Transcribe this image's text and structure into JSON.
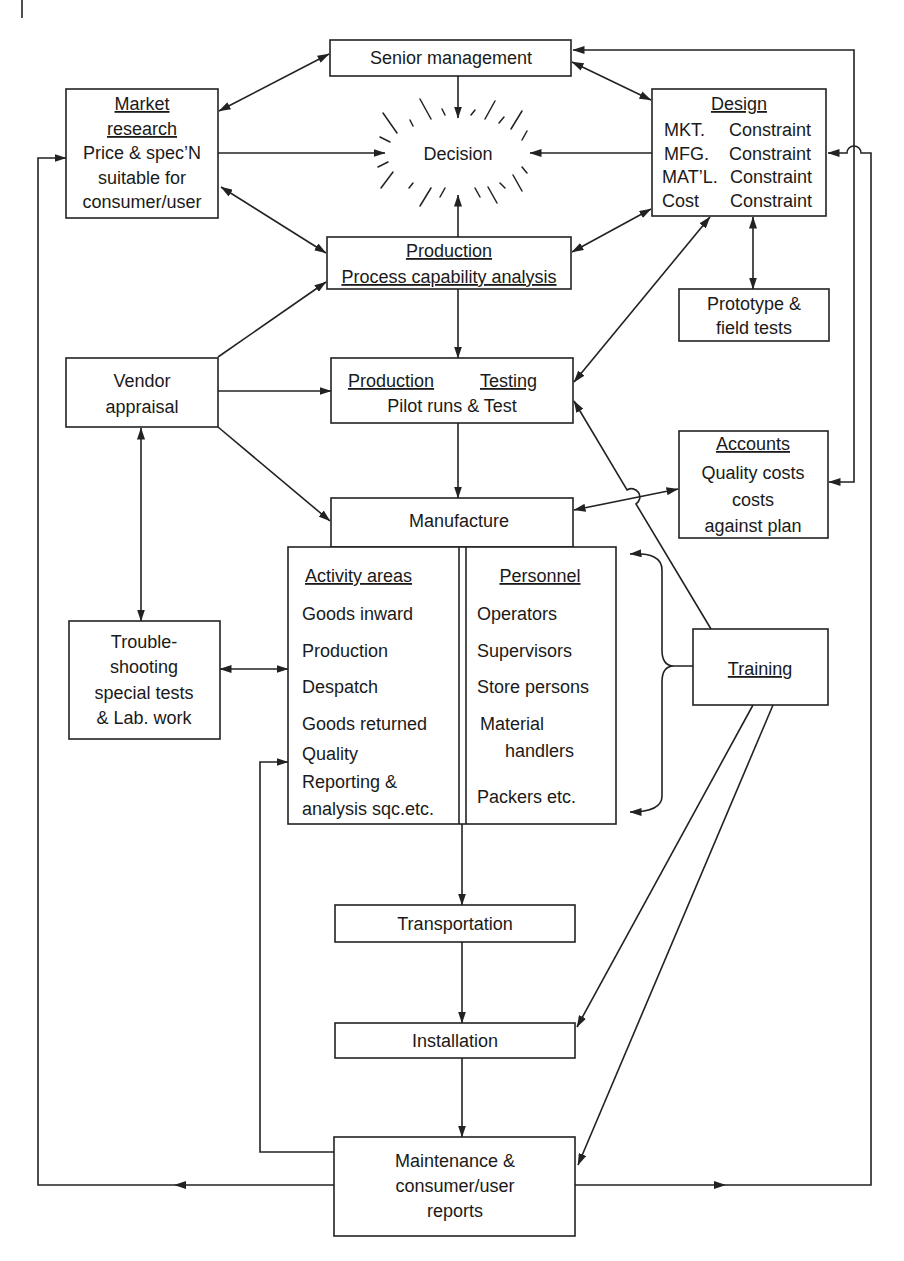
{
  "diagram": {
    "colors": {
      "stroke": "#222222",
      "text": "#1a1a1a",
      "background": "#ffffff"
    },
    "senior_management": {
      "label": "Senior management"
    },
    "decision": {
      "label": "Decision"
    },
    "market_research": {
      "title_line1": "Market",
      "title_line2": "research",
      "lines": [
        "Price & spec’N",
        "suitable for",
        "consumer/user"
      ]
    },
    "design": {
      "title": "Design",
      "rows": [
        {
          "key": "MKT.",
          "value": "Constraint"
        },
        {
          "key": "MFG.",
          "value": "Constraint"
        },
        {
          "key": "MAT’L.",
          "value": "Constraint"
        },
        {
          "key": "Cost",
          "value": "Constraint"
        }
      ]
    },
    "production": {
      "title": "Production",
      "subtitle": "Process capability analysis"
    },
    "prototype": {
      "lines": [
        "Prototype &",
        "field tests"
      ]
    },
    "vendor": {
      "lines": [
        "Vendor",
        "appraisal"
      ]
    },
    "production_testing": {
      "title_left": "Production",
      "title_right": "Testing",
      "subtitle": "Pilot runs & Test"
    },
    "accounts": {
      "title": "Accounts",
      "lines": [
        "Quality costs",
        "costs",
        "against plan"
      ]
    },
    "manufacture": {
      "label": "Manufacture"
    },
    "activity_areas": {
      "title": "Activity areas",
      "items": [
        "Goods inward",
        "Production",
        "Despatch",
        "Goods returned",
        "Quality",
        "Reporting &",
        "analysis sqc.etc."
      ]
    },
    "personnel": {
      "title": "Personnel",
      "items": [
        "Operators",
        "Supervisors",
        "Store persons",
        "Material",
        "handlers",
        "Packers etc."
      ]
    },
    "troubleshooting": {
      "lines": [
        "Trouble-",
        "shooting",
        "special tests",
        "& Lab. work"
      ]
    },
    "training": {
      "title": "Training"
    },
    "transportation": {
      "label": "Transportation"
    },
    "installation": {
      "label": "Installation"
    },
    "maintenance": {
      "lines": [
        "Maintenance &",
        "consumer/user",
        "reports"
      ]
    }
  }
}
